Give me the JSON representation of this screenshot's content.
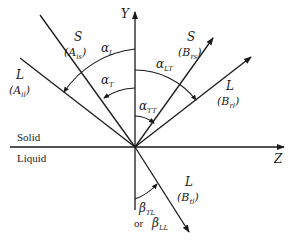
{
  "axes": {
    "y_label": "Y",
    "z_label": "Z"
  },
  "media": {
    "upper": "Solid",
    "lower": "Liquid"
  },
  "waves": {
    "incident_shear": {
      "mode": "S",
      "amplitude": "(A",
      "amp_sub": "is",
      "close": ")"
    },
    "incident_longitudinal": {
      "mode": "L",
      "amplitude": "(A",
      "amp_sub": "il",
      "close": ")"
    },
    "reflected_shear": {
      "mode": "S",
      "amplitude": "(B",
      "amp_sub": "rs",
      "close": ")"
    },
    "reflected_longitudinal": {
      "mode": "L",
      "amplitude": "(B",
      "amp_sub": "rl",
      "close": ")"
    },
    "transmitted_longitudinal": {
      "mode": "L",
      "amplitude": "(B",
      "amp_sub": "tl",
      "close": ")"
    }
  },
  "angles": {
    "alpha_L": {
      "sym": "α",
      "sub": "L"
    },
    "alpha_T": {
      "sym": "α",
      "sub": "T"
    },
    "alpha_LT": {
      "sym": "α",
      "sub": "LT"
    },
    "alpha_TT": {
      "sym": "α",
      "sub": "TT"
    },
    "beta_TL": {
      "sym": "β",
      "sub": "TL"
    },
    "or_text": "or",
    "beta_LL": {
      "sym": "β",
      "sub": "LL"
    }
  },
  "colors": {
    "ink": "#1a1a1a",
    "background": "#ffffff"
  }
}
